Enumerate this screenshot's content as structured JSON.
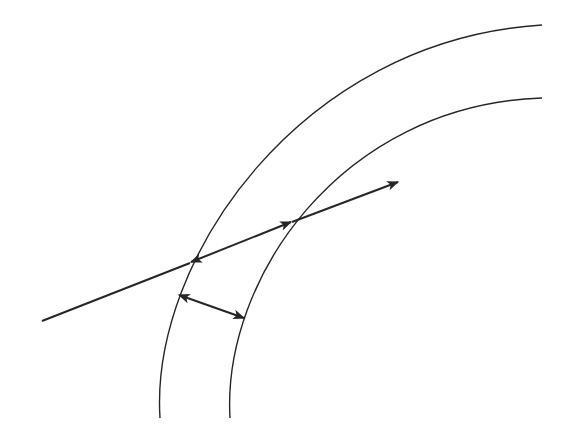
{
  "diagram": {
    "type": "concentric-arcs-with-ray",
    "background": "#ffffff",
    "stroke_color": "#262626",
    "arcs": [
      {
        "name": "outer-arc",
        "start": [
          160,
          418
        ],
        "end": [
          542,
          25
        ]
      },
      {
        "name": "inner-arc",
        "start": [
          230,
          418
        ],
        "end": [
          542,
          98
        ]
      }
    ],
    "ray": {
      "start": [
        42,
        321
      ],
      "end": [
        398,
        182
      ],
      "arrowhead": "end"
    },
    "dimension_arrows": [
      {
        "name": "along-ray-thickness",
        "from": [
          190,
          262
        ],
        "to": [
          292,
          222
        ],
        "heads": "both"
      },
      {
        "name": "perpendicular-thickness",
        "from": [
          179,
          295
        ],
        "to": [
          244,
          318
        ],
        "heads": "both"
      }
    ]
  }
}
